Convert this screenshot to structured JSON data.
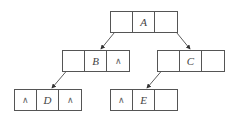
{
  "diagram": {
    "type": "binary-tree-linked-list-representation",
    "null_symbol": "∧",
    "nodes": [
      {
        "id": "A",
        "label": "A",
        "left": "ptr",
        "right": "ptr",
        "x": 110,
        "y": 11
      },
      {
        "id": "B",
        "label": "B",
        "left": "ptr",
        "right": "∧",
        "x": 62,
        "y": 50
      },
      {
        "id": "C",
        "label": "C",
        "left": "ptr",
        "right": "",
        "x": 157,
        "y": 50
      },
      {
        "id": "D",
        "label": "D",
        "left": "∧",
        "right": "∧",
        "x": 14,
        "y": 89
      },
      {
        "id": "E",
        "label": "E",
        "left": "∧",
        "right": "",
        "x": 110,
        "y": 89
      }
    ],
    "edges": [
      {
        "from": "A",
        "to": "B"
      },
      {
        "from": "A",
        "to": "C"
      },
      {
        "from": "B",
        "to": "D"
      },
      {
        "from": "C",
        "to": "E"
      }
    ]
  },
  "labels": {
    "A": "A",
    "B": "B",
    "C": "C",
    "D": "D",
    "E": "E",
    "nil": "∧"
  }
}
